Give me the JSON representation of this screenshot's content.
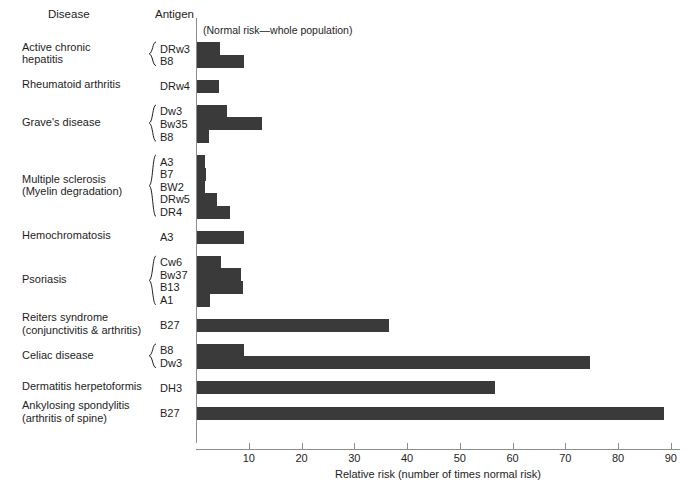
{
  "headers": {
    "disease": "Disease",
    "antigen": "Antigen",
    "note": "(Normal risk—whole population)"
  },
  "chart_data": {
    "type": "bar",
    "orientation": "horizontal",
    "title": "",
    "subtitle": "(Normal risk—whole population)",
    "xlabel": "Relative risk (number of times normal risk)",
    "ylabel": "",
    "xlim": [
      0,
      92
    ],
    "xticks": [
      10,
      20,
      30,
      40,
      50,
      60,
      70,
      80,
      90
    ],
    "xticklabels": [
      "10",
      "20",
      "30",
      "40",
      "50",
      "60",
      "70",
      "80",
      "90"
    ],
    "grid": false,
    "legend": "none",
    "bar_color": "#3a3a3a",
    "groups": [
      {
        "disease": "Active chronic hepatitis",
        "disease_lines": [
          "Active chronic",
          "hepatitis"
        ],
        "braced": true,
        "rows": [
          {
            "antigen": "DRw3",
            "value": 4.3
          },
          {
            "antigen": "B8",
            "value": 9.0
          }
        ]
      },
      {
        "disease": "Rheumatoid arthritis",
        "disease_lines": [
          "Rheumatoid arthritis"
        ],
        "braced": false,
        "rows": [
          {
            "antigen": "DRw4",
            "value": 4.2
          }
        ]
      },
      {
        "disease": "Grave's disease",
        "disease_lines": [
          "Grave's disease"
        ],
        "braced": true,
        "rows": [
          {
            "antigen": "Dw3",
            "value": 5.6
          },
          {
            "antigen": "Bw35",
            "value": 12.3
          },
          {
            "antigen": "B8",
            "value": 2.2
          }
        ]
      },
      {
        "disease": "Multiple sclerosis (Myelin degradation)",
        "disease_lines": [
          "Multiple sclerosis",
          "(Myelin degradation)"
        ],
        "braced": true,
        "rows": [
          {
            "antigen": "A3",
            "value": 1.5
          },
          {
            "antigen": "B7",
            "value": 1.7
          },
          {
            "antigen": "BW2",
            "value": 1.5
          },
          {
            "antigen": "DRw5",
            "value": 3.8
          },
          {
            "antigen": "DR4",
            "value": 6.2
          }
        ]
      },
      {
        "disease": "Hemochromatosis",
        "disease_lines": [
          "Hemochromatosis"
        ],
        "braced": false,
        "rows": [
          {
            "antigen": "A3",
            "value": 9.0
          }
        ]
      },
      {
        "disease": "Psoriasis",
        "disease_lines": [
          "Psoriasis"
        ],
        "braced": true,
        "rows": [
          {
            "antigen": "Cw6",
            "value": 4.5
          },
          {
            "antigen": "Bw37",
            "value": 8.3
          },
          {
            "antigen": "B13",
            "value": 8.7
          },
          {
            "antigen": "A1",
            "value": 2.5
          }
        ]
      },
      {
        "disease": "Reiters syndrome (conjunctivitis & arthritis)",
        "disease_lines": [
          "Reiters syndrome",
          "(conjunctivitis & arthritis)"
        ],
        "braced": false,
        "rows": [
          {
            "antigen": "B27",
            "value": 36.4
          }
        ]
      },
      {
        "disease": "Celiac disease",
        "disease_lines": [
          "Celiac disease"
        ],
        "braced": true,
        "rows": [
          {
            "antigen": "B8",
            "value": 8.9
          },
          {
            "antigen": "Dw3",
            "value": 74.5
          }
        ]
      },
      {
        "disease": "Dermatitis herpetoformis",
        "disease_lines": [
          "Dermatitis herpetoformis"
        ],
        "braced": false,
        "rows": [
          {
            "antigen": "DH3",
            "value": 56.5
          }
        ]
      },
      {
        "disease": "Ankylosing spondylitis (arthritis of spine)",
        "disease_lines": [
          "Ankylosing spondylitis",
          "(arthritis of spine)"
        ],
        "braced": false,
        "rows": [
          {
            "antigen": "B27",
            "value": 88.5
          }
        ]
      }
    ]
  }
}
